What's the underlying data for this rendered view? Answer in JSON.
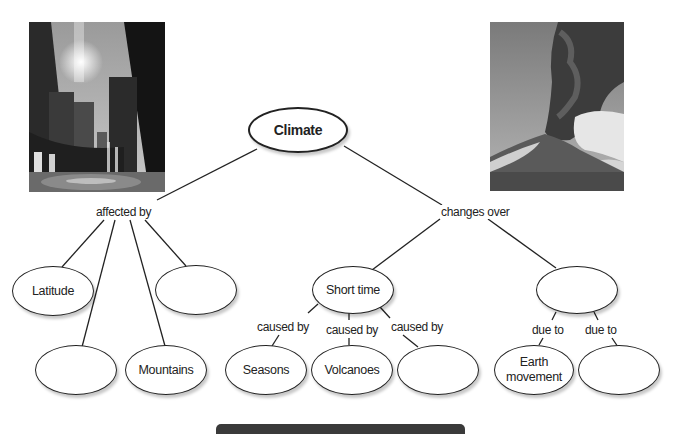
{
  "diagram": {
    "type": "concept-map",
    "root": {
      "id": "climate",
      "label": "Climate"
    },
    "link_labels": {
      "affected_by": "affected by",
      "changes_over": "changes over",
      "caused_by_1": "caused by",
      "caused_by_2": "caused by",
      "caused_by_3": "caused by",
      "due_to_1": "due to",
      "due_to_2": "due to"
    },
    "nodes": {
      "latitude": "Latitude",
      "blank_affected_1": "",
      "blank_affected_2": "",
      "mountains": "Mountains",
      "short_time": "Short time",
      "blank_long_time": "",
      "seasons": "Seasons",
      "volcanoes": "Volcanoes",
      "blank_caused_by": "",
      "earth_movement": "Earth movement",
      "blank_due_to": ""
    },
    "edges": [
      [
        "Climate",
        "affected by"
      ],
      [
        "affected by",
        "Latitude"
      ],
      [
        "affected by",
        "(blank)"
      ],
      [
        "affected by",
        "Mountains"
      ],
      [
        "affected by",
        "(blank)"
      ],
      [
        "Climate",
        "changes over"
      ],
      [
        "changes over",
        "Short time"
      ],
      [
        "changes over",
        "(blank)"
      ],
      [
        "Short time",
        "caused by",
        "Seasons"
      ],
      [
        "Short time",
        "caused by",
        "Volcanoes"
      ],
      [
        "Short time",
        "caused by",
        "(blank)"
      ],
      [
        "(blank)",
        "due to",
        "Earth movement"
      ],
      [
        "(blank)",
        "due to",
        "(blank)"
      ]
    ]
  },
  "images": {
    "left_photo": "city-skyline-fountain-photo",
    "right_photo": "volcano-eruption-photo"
  },
  "colors": {
    "stroke": "#222222",
    "background": "#ffffff",
    "bottom_bar": "#3a3a3a"
  }
}
